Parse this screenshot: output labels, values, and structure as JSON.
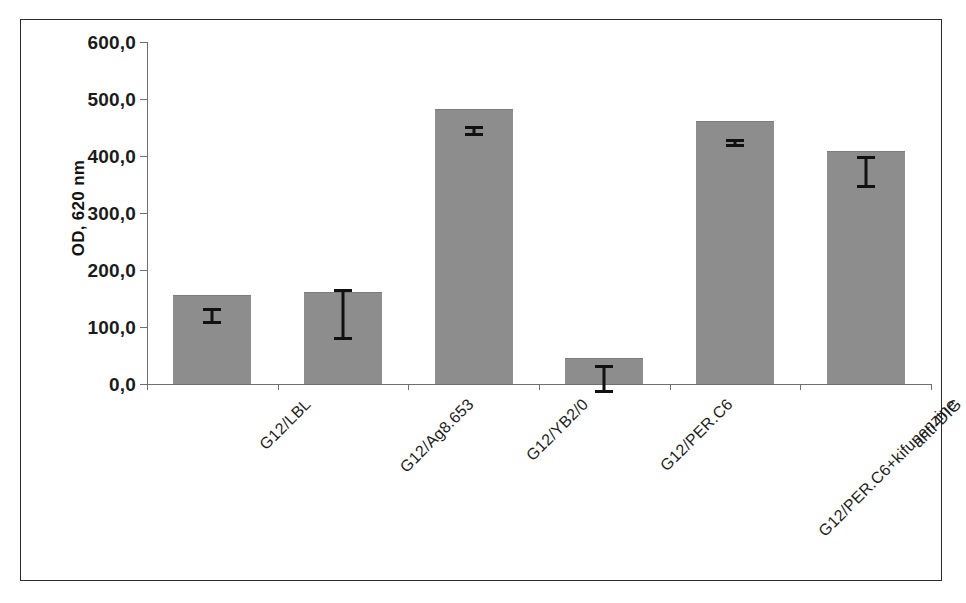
{
  "chart_data": {
    "type": "bar",
    "title": "",
    "subtitle": "",
    "xlabel": "",
    "ylabel": "OD, 620 nm",
    "ylim": [
      0,
      600
    ],
    "ytick_values": [
      600,
      500,
      400,
      300,
      200,
      100,
      0
    ],
    "ytick_labels": [
      "600,0",
      "500,0",
      "400,0",
      "300,0",
      "200,0",
      "100,0",
      "0,0"
    ],
    "grid": false,
    "legend": null,
    "bar_color": "#8d8d8d",
    "error_bar_color": "#111111",
    "axis_color": "#6f6f6f",
    "categories": [
      "G12/LBL",
      "G12/Ag8.653",
      "G12/YB2/0",
      "G12/PER.C6",
      "G12/PER.C6+kifunenzine",
      "anti-DIG"
    ],
    "values": [
      157,
      161,
      483,
      46,
      461,
      408
    ],
    "errors_upper": [
      172,
      205,
      491,
      72,
      468,
      438
    ],
    "errors_lower": [
      143,
      115,
      474,
      23,
      455,
      382
    ],
    "series": [
      {
        "name": "OD, 620 nm",
        "values": [
          157,
          161,
          483,
          46,
          461,
          408
        ]
      }
    ]
  },
  "axes": {
    "y_title": "OD, 620 nm"
  }
}
